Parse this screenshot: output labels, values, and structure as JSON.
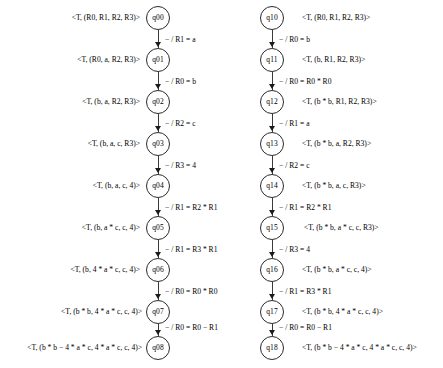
{
  "diagram": {
    "type": "state-transition-chain",
    "columns": [
      {
        "id": "left",
        "label_side": "left",
        "states": [
          {
            "name": "q00",
            "label": "<T, (R0, R1, R2, R3)>"
          },
          {
            "name": "q01",
            "label": "<T, (R0, a, R2, R3)>"
          },
          {
            "name": "q02",
            "label": "<T, (b, a, R2, R3)>"
          },
          {
            "name": "q03",
            "label": "<T, (b, a, c, R3)>"
          },
          {
            "name": "q04",
            "label": "<T, (b, a, c, 4)>"
          },
          {
            "name": "q05",
            "label": "<T, (b, a * c, c, 4)>"
          },
          {
            "name": "q06",
            "label": "<T, (b, 4 * a * c, c, 4)>"
          },
          {
            "name": "q07",
            "label": "<T, (b * b, 4 * a * c, c, 4)>"
          },
          {
            "name": "q08",
            "label": "<T, (b * b − 4 * a * c, 4 * a * c, c, 4)>"
          }
        ],
        "transitions": [
          "− / R1 = a",
          "− / R0 = b",
          "− / R2 = c",
          "− / R3 = 4",
          "− / R1 = R2 * R1",
          "− / R1 = R3 * R1",
          "− / R0 = R0 * R0",
          "− / R0 = R0 − R1"
        ]
      },
      {
        "id": "right",
        "label_side": "right",
        "states": [
          {
            "name": "q10",
            "label": "<T, (R0, R1, R2, R3)>"
          },
          {
            "name": "q11",
            "label": "<T, (b, R1, R2, R3)>"
          },
          {
            "name": "q12",
            "label": "<T, (b * b, R1, R2, R3)>"
          },
          {
            "name": "q13",
            "label": "<T, (b * b, a, R2, R3)>"
          },
          {
            "name": "q14",
            "label": "<T, (b * b, a, c, R3)>"
          },
          {
            "name": "q15",
            "label": "<T, (b * b, a * c, c, R3)>"
          },
          {
            "name": "q16",
            "label": "<T, (b * b, a * c, c, 4)>"
          },
          {
            "name": "q17",
            "label": "<T, (b * b, 4 * a * c, c, 4)>"
          },
          {
            "name": "q18",
            "label": "<T, (b * b − 4 * a * c, 4 * a * c, c, 4)>"
          }
        ],
        "transitions": [
          "− / R0 = b",
          "− / R0 = R0 * R0",
          "− / R1 = a",
          "− / R2 = c",
          "− / R1 = R2 * R1",
          "− / R3 = 4",
          "− / R1 = R3 * R1",
          "− / R0 = R0 − R1"
        ]
      }
    ],
    "colors": {
      "node_stroke": "#2b2b2b",
      "edge": "#3a3a3a",
      "text": "#000000",
      "background": "#ffffff"
    }
  }
}
